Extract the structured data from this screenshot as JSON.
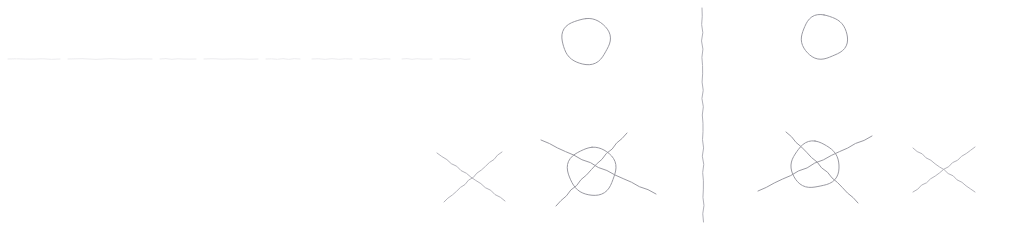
{
  "canvas": {
    "width": 1010,
    "height": 230,
    "background_color": "#ffffff",
    "title": "Hand-drawn sketch: mirrored circle and cross symbols",
    "medium": "pencil on white paper"
  },
  "colors": {
    "background": "#ffffff",
    "ink": "#9a9aa2",
    "ink_light": "#b4b4bb",
    "ink_faint": "#e6e6ea",
    "divider": "#b0b0b8"
  },
  "strokes": {
    "ink_width": 1,
    "faint_width": 1
  },
  "divider": {
    "label": "vertical divider line",
    "x": 702,
    "y_top": 8,
    "y_bottom": 222,
    "color": "#b0b0b8"
  },
  "faint_rule": {
    "label": "faint broken horizontal guide line",
    "y": 59,
    "x_start": 8,
    "x_end": 470,
    "color": "#e9e9ec",
    "segments": [
      {
        "x1": 8,
        "x2": 60
      },
      {
        "x1": 68,
        "x2": 152
      },
      {
        "x1": 160,
        "x2": 196
      },
      {
        "x1": 204,
        "x2": 258
      },
      {
        "x1": 266,
        "x2": 300
      },
      {
        "x1": 312,
        "x2": 352
      },
      {
        "x1": 360,
        "x2": 390
      },
      {
        "x1": 402,
        "x2": 432
      },
      {
        "x1": 440,
        "x2": 470
      }
    ]
  },
  "groups": [
    {
      "name": "left-group",
      "label": "Left group",
      "side": "left",
      "shapes": [
        {
          "id": "left-circle",
          "type": "circle",
          "label": "open circle",
          "cx": 586,
          "cy": 41,
          "rx": 24,
          "ry": 23,
          "color": "#9a9aa2"
        },
        {
          "id": "left-cross",
          "type": "cross",
          "label": "X mark",
          "cx": 470,
          "cy": 177,
          "stroke_a": {
            "x1": 437,
            "y1": 153,
            "x2": 505,
            "y2": 201
          },
          "stroke_b": {
            "x1": 444,
            "y1": 202,
            "x2": 502,
            "y2": 152
          },
          "color": "#b4b4bb"
        },
        {
          "id": "left-circled-cross",
          "type": "circled-cross",
          "label": "circle with X through it",
          "cx": 592,
          "cy": 171,
          "rx": 24,
          "ry": 24,
          "stroke_a": {
            "x1": 541,
            "y1": 140,
            "x2": 656,
            "y2": 194
          },
          "stroke_b": {
            "x1": 556,
            "y1": 206,
            "x2": 627,
            "y2": 133
          },
          "color": "#9a9aa2"
        }
      ]
    },
    {
      "name": "right-group",
      "label": "Right group",
      "side": "right",
      "shapes": [
        {
          "id": "right-circle",
          "type": "circle",
          "label": "open circle",
          "cx": 824,
          "cy": 37,
          "rx": 23,
          "ry": 22,
          "color": "#9a9aa2"
        },
        {
          "id": "right-circled-cross",
          "type": "circled-cross",
          "label": "circle with X through it",
          "cx": 815,
          "cy": 165,
          "rx": 24,
          "ry": 23,
          "stroke_a": {
            "x1": 758,
            "y1": 191,
            "x2": 872,
            "y2": 136
          },
          "stroke_b": {
            "x1": 786,
            "y1": 132,
            "x2": 858,
            "y2": 203
          },
          "color": "#9a9aa2"
        },
        {
          "id": "right-cross",
          "type": "cross",
          "label": "X mark",
          "cx": 943,
          "cy": 170,
          "stroke_a": {
            "x1": 913,
            "y1": 148,
            "x2": 975,
            "y2": 192
          },
          "stroke_b": {
            "x1": 913,
            "y1": 192,
            "x2": 975,
            "y2": 147
          },
          "color": "#b4b4bb"
        }
      ]
    }
  ],
  "legend": {
    "symbols": [
      {
        "key": "circle",
        "meaning": "circle"
      },
      {
        "key": "cross",
        "meaning": "X"
      },
      {
        "key": "circled-cross",
        "meaning": "circled X"
      }
    ]
  }
}
